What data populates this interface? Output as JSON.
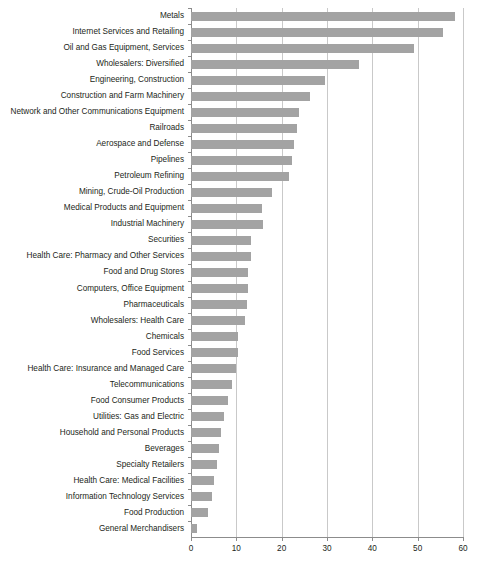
{
  "chart_data": {
    "type": "bar",
    "orientation": "horizontal",
    "title": "",
    "subtitle": "",
    "xlabel": "",
    "ylabel": "",
    "xlim": [
      0,
      60
    ],
    "ylim": null,
    "xticks": [
      0,
      10,
      20,
      30,
      40,
      50,
      60
    ],
    "xtick_labels": [
      "0",
      "10",
      "20",
      "30",
      "40",
      "50",
      "60"
    ],
    "grid": "vertical",
    "legend": null,
    "legend_position": "none",
    "bar_color": "#a3a3a3",
    "axis_color": "#8c8c8c",
    "gridline_color": "#c9c9c9",
    "text_color": "#231f20",
    "categories": [
      "Metals",
      "Internet Services and Retailing",
      "Oil and Gas Equipment, Services",
      "Wholesalers: Diversified",
      "Engineering, Construction",
      "Construction and Farm Machinery",
      "Network and Other Communications Equipment",
      "Railroads",
      "Aerospace and Defense",
      "Pipelines",
      "Petroleum Refining",
      "Mining, Crude-Oil Production",
      "Medical Products and Equipment",
      "Industrial Machinery",
      "Securities",
      "Health Care: Pharmacy and Other Services",
      "Food and Drug Stores",
      "Computers, Office Equipment",
      "Pharmaceuticals",
      "Wholesalers: Health Care",
      "Chemicals",
      "Food Services",
      "Health Care: Insurance and Managed Care",
      "Telecommunications",
      "Food Consumer Products",
      "Utilities: Gas and Electric",
      "Household and Personal Products",
      "Beverages",
      "Specialty Retailers",
      "Health Care: Medical Facilities",
      "Information Technology Services",
      "Food Production",
      "General Merchandisers"
    ],
    "values": [
      58.3,
      55.6,
      49.2,
      37.0,
      29.6,
      26.2,
      23.8,
      23.4,
      22.7,
      22.3,
      21.6,
      17.9,
      15.7,
      15.9,
      13.2,
      13.2,
      12.6,
      12.6,
      12.4,
      11.9,
      10.4,
      10.4,
      9.9,
      9.1,
      8.1,
      7.3,
      6.6,
      6.2,
      5.7,
      5.1,
      4.6,
      3.8,
      1.3
    ]
  }
}
